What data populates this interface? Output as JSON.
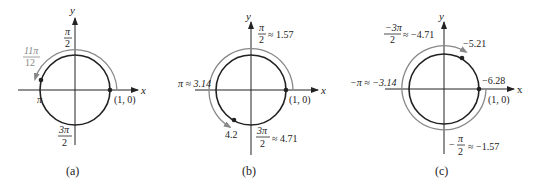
{
  "panels": [
    {
      "id": "a",
      "caption": "(a)",
      "axis_x": "x",
      "axis_y": "y",
      "top_num": "π",
      "top_den": "2",
      "left_label": "π",
      "bottom_num": "3π",
      "bottom_den": "2",
      "point_label": "(1, 0)",
      "arc_num": "11π",
      "arc_den": "12"
    },
    {
      "id": "b",
      "caption": "(b)",
      "axis_x": "x",
      "axis_y": "y",
      "top_num": "π",
      "top_den": "2",
      "top_approx": "≈ 1.57",
      "left_label": "π ≈ 3.14",
      "bottom_num": "3π",
      "bottom_den": "2",
      "bottom_approx": "≈ 4.71",
      "point_label": "(1, 0)",
      "arc_label": "4.2"
    },
    {
      "id": "c",
      "caption": "(c)",
      "axis_x": "x",
      "axis_y": "y",
      "top_num": "−3π",
      "top_den": "2",
      "top_approx": "≈ −4.71",
      "left_label": "−π ≈ −3.14",
      "right_label": "−6.28",
      "bottom_prefix": "−",
      "bottom_num": "π",
      "bottom_den": "2",
      "bottom_approx": "≈ −1.57",
      "point_label": "(1, 0)",
      "arc_label": "−5.21"
    }
  ],
  "colors": {
    "ink": "#222222",
    "arc": "#888888"
  }
}
